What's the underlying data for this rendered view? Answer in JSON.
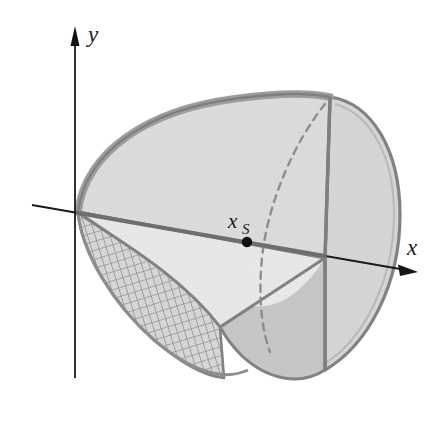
{
  "figure": {
    "kind": "3d-solid-diagram",
    "background_color": "#ffffff"
  },
  "axes": {
    "y_axis": {
      "label": "y",
      "orientation": "vertical",
      "arrow": "up",
      "color": "#1a1a1a",
      "x": 75,
      "y_top": 30,
      "y_bottom": 378
    },
    "x_axis": {
      "label": "x",
      "orientation": "oblique-right-down",
      "arrow": "right",
      "color": "#1a1a1a",
      "x_start": 32,
      "y_start": 206,
      "x_end": 412,
      "y_end": 272
    }
  },
  "annotations": {
    "centroid": {
      "label_main": "x",
      "label_sub": "S",
      "dot_color": "#111111",
      "dot_x": 247,
      "dot_y": 240,
      "label_x": 232,
      "label_y": 226
    }
  },
  "colors": {
    "solid_top_face": "#dcdcdc",
    "solid_front_lower_face": "#e8e8e8",
    "end_cap_light": "#d8d8d8",
    "end_cap_shadow": "#c9c9c9",
    "lower_right_lobe": "#c8c8c8",
    "rim_band_dark": "#999999",
    "outline": "#7a7a7a",
    "mesh_line": "#8f8f8f",
    "dashed_edge": "#8a8a8a",
    "axis_ink": "#1a1a1a"
  },
  "surfaces": {
    "mesh_region": {
      "name": "hatched-lower-left-surface",
      "pattern": "cross-hatch-grid",
      "rows": 12,
      "cols": 34
    },
    "dashed_hidden_edge": {
      "name": "hidden-cut-edge",
      "style": "dashed",
      "dash_pattern": "7 6"
    }
  }
}
